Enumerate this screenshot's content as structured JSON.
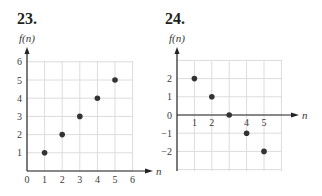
{
  "problems": [
    {
      "number": "23."
    },
    {
      "number": "24."
    }
  ],
  "colors": {
    "grid": "#dcdcdc",
    "axis": "#222222",
    "point": "#333333"
  },
  "chart_data": [
    {
      "type": "scatter",
      "title": "23.",
      "xlabel": "n",
      "ylabel": "f(n)",
      "xlim": [
        0,
        6
      ],
      "ylim": [
        0,
        6
      ],
      "grid": true,
      "x_ticks": [
        "0",
        "1",
        "2",
        "3",
        "4",
        "5",
        "6"
      ],
      "y_ticks": [
        "1",
        "2",
        "3",
        "4",
        "5",
        "6"
      ],
      "x": [
        1,
        2,
        3,
        4,
        5
      ],
      "y": [
        1,
        2,
        3,
        4,
        5
      ]
    },
    {
      "type": "scatter",
      "title": "24.",
      "xlabel": "n",
      "ylabel": "f(n)",
      "xlim": [
        0,
        6
      ],
      "ylim": [
        -3,
        3
      ],
      "grid": true,
      "x_ticks": [
        "1",
        "2",
        "4",
        "5"
      ],
      "y_ticks": [
        "2",
        "1",
        "0",
        "-1",
        "-2"
      ],
      "x": [
        1,
        2,
        3,
        4,
        5
      ],
      "y": [
        2,
        1,
        0,
        -1,
        -2
      ]
    }
  ]
}
